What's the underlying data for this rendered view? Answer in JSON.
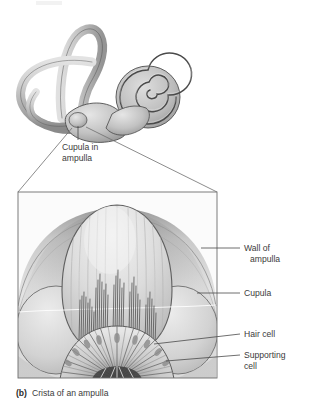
{
  "figure": {
    "caption_marker": "(b)",
    "caption_text": "Crista of an ampulla",
    "title_alt": "Crista of an ampulla"
  },
  "upper_diagram": {
    "name": "bony-labyrinth-of-inner-ear",
    "callout": {
      "line1": "Cupula in",
      "line2": "ampulla"
    },
    "parts": [
      "anterior semicircular canal",
      "posterior semicircular canal",
      "lateral semicircular canal",
      "vestibule",
      "cochlea",
      "ampulla"
    ]
  },
  "detail_diagram": {
    "name": "crista-ampullaris-cross-section",
    "labels": [
      {
        "id": "wall-of-ampulla",
        "line1": "Wall of",
        "line2": "ampulla"
      },
      {
        "id": "cupula",
        "line1": "Cupula",
        "line2": ""
      },
      {
        "id": "hair-cell",
        "line1": "Hair cell",
        "line2": ""
      },
      {
        "id": "supporting-cell",
        "line1": "Supporting",
        "line2": "cell"
      }
    ],
    "structures": {
      "cupula": "gelatinous dome",
      "stereocilia_bundles": 5,
      "crista_epithelium": "fan of columnar supporting cells and hair cells"
    }
  },
  "colors": {
    "ink": "#3b3b3b",
    "line": "#4a4a4a",
    "frame": "#6e6e6e",
    "tissue_light": "#e8e8e8",
    "tissue_mid": "#bdbdbd",
    "tissue_dark": "#8c8c8c",
    "tissue_deep": "#5e5e5e",
    "background": "#ffffff"
  }
}
